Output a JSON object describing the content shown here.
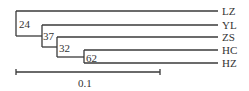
{
  "diagram": {
    "type": "phylogenetic-tree",
    "leaves": [
      {
        "label": "LZ",
        "y": 11
      },
      {
        "label": "YL",
        "y": 25
      },
      {
        "label": "ZS",
        "y": 37
      },
      {
        "label": "HC",
        "y": 50
      },
      {
        "label": "HZ",
        "y": 63
      }
    ],
    "nodes": [
      {
        "support": "24",
        "x": 16,
        "top": 11,
        "bottom": 36
      },
      {
        "support": "37",
        "x": 42,
        "top": 25,
        "bottom": 47
      },
      {
        "support": "32",
        "x": 57,
        "top": 37,
        "bottom": 57
      },
      {
        "support": "62",
        "x": 84,
        "top": 50,
        "bottom": 63
      }
    ],
    "scale_bar": {
      "label": "0.1",
      "x1": 16,
      "x2": 160,
      "y": 72
    },
    "leaf_end_x": 218,
    "colors": {
      "line": "#3a3a3a",
      "text": "#333333"
    }
  }
}
